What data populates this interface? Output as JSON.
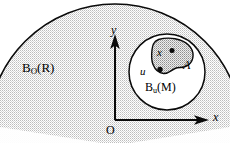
{
  "figure": {
    "type": "diagram",
    "background_color": "#ffffff",
    "stroke_color": "#0a0a0a",
    "shade_color": "#e3e3e3",
    "blob_shade_color": "#c9c9c9",
    "labels": {
      "outer_ball": {
        "base": "B",
        "subscript": "O",
        "argument": "(R)",
        "text": "B_O(R)"
      },
      "inner_ball": {
        "base": "B",
        "subscript": "u",
        "argument": "(M)",
        "text": "B_u(M)"
      },
      "blob": "A",
      "point_x": "x",
      "point_u": "u",
      "axis_y": "y",
      "axis_x": "x",
      "origin": "O"
    },
    "geometry": {
      "outer_ball_center": [
        115,
        131
      ],
      "outer_ball_radius": 127,
      "inner_ball_center": [
        167,
        72
      ],
      "inner_ball_radius": 38,
      "point_u": [
        160,
        69
      ],
      "point_x": [
        172,
        51
      ],
      "axis_origin": [
        115,
        120
      ],
      "y_axis_tip": [
        115,
        38
      ],
      "x_axis_tip": [
        207,
        120
      ]
    }
  }
}
